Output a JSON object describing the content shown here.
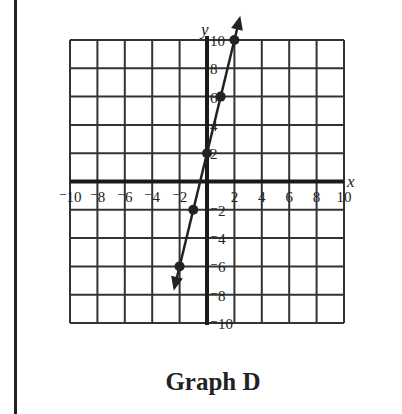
{
  "title": "Graph D",
  "chart_data": {
    "type": "line",
    "title": "Graph D",
    "xlabel": "x",
    "ylabel": "y",
    "xlim": [
      -10,
      10
    ],
    "ylim": [
      -10,
      10
    ],
    "grid": true,
    "grid_step": 2,
    "x_ticks": [
      "-10",
      "-8",
      "-6",
      "-4",
      "-2",
      "2",
      "4",
      "6",
      "8",
      "10"
    ],
    "y_ticks": [
      "10",
      "8",
      "6",
      "4",
      "2",
      "-2",
      "-4",
      "-6",
      "-8",
      "-10"
    ],
    "equation": "y = 4x + 2",
    "series": [
      {
        "name": "line",
        "points": [
          [
            -2,
            -6
          ],
          [
            -1,
            -2
          ],
          [
            0,
            2
          ],
          [
            1,
            6
          ],
          [
            2,
            10
          ]
        ],
        "arrows": "both",
        "color": "#222222"
      }
    ]
  }
}
